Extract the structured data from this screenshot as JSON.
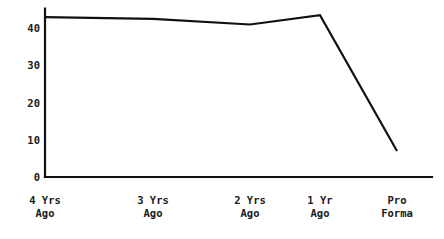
{
  "chart_data": {
    "type": "line",
    "title": "",
    "subtitle": "",
    "xlabel": "",
    "ylabel": "",
    "categories": [
      "4 Yrs\nAgo",
      "3 Yrs\nAgo",
      "2 Yrs\nAgo",
      "1 Yr\nAgo",
      "Pro\nForma"
    ],
    "category_lines": [
      [
        "4 Yrs",
        "Ago"
      ],
      [
        "3 Yrs",
        "Ago"
      ],
      [
        "2 Yrs",
        "Ago"
      ],
      [
        "1 Yr",
        "Ago"
      ],
      [
        "Pro",
        "Forma"
      ]
    ],
    "values": [
      43,
      42.5,
      41,
      43.5,
      7
    ],
    "ylim": [
      0,
      45
    ],
    "yticks": [
      0,
      10,
      20,
      30,
      40
    ],
    "ytick_labels": [
      "0",
      "10",
      "20",
      "30",
      "40"
    ],
    "grid": false,
    "legend": null,
    "series": [
      {
        "name": "",
        "values": [
          43,
          42.5,
          41,
          43.5,
          7
        ]
      }
    ],
    "line_color": "#111111",
    "axis_color": "#111111",
    "background_color": "#ffffff"
  },
  "geometry": {
    "plot_left": 45,
    "plot_right": 432,
    "baseline_y": 177,
    "top_y": 10,
    "px_per_unit": 3.72,
    "x_positions": [
      45,
      153,
      250,
      320,
      397
    ]
  }
}
